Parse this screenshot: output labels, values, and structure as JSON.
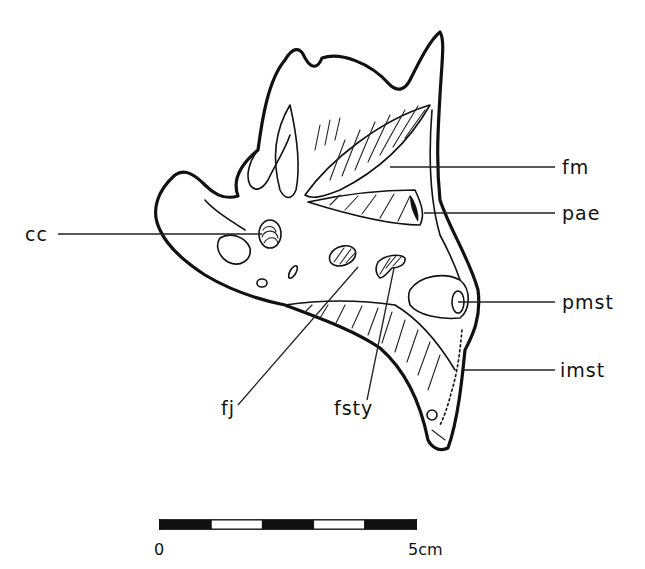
{
  "figure": {
    "labels": [
      {
        "id": "cc",
        "text": "cc"
      },
      {
        "id": "fm",
        "text": "fm"
      },
      {
        "id": "pae",
        "text": "pae"
      },
      {
        "id": "pmst",
        "text": "pmst"
      },
      {
        "id": "imst",
        "text": "imst"
      },
      {
        "id": "fj",
        "text": "fj"
      },
      {
        "id": "fsty",
        "text": "fsty"
      }
    ]
  },
  "scale_bar": {
    "start_label": "0",
    "end_label": "5cm",
    "segments": 5,
    "length_cm": 5
  }
}
